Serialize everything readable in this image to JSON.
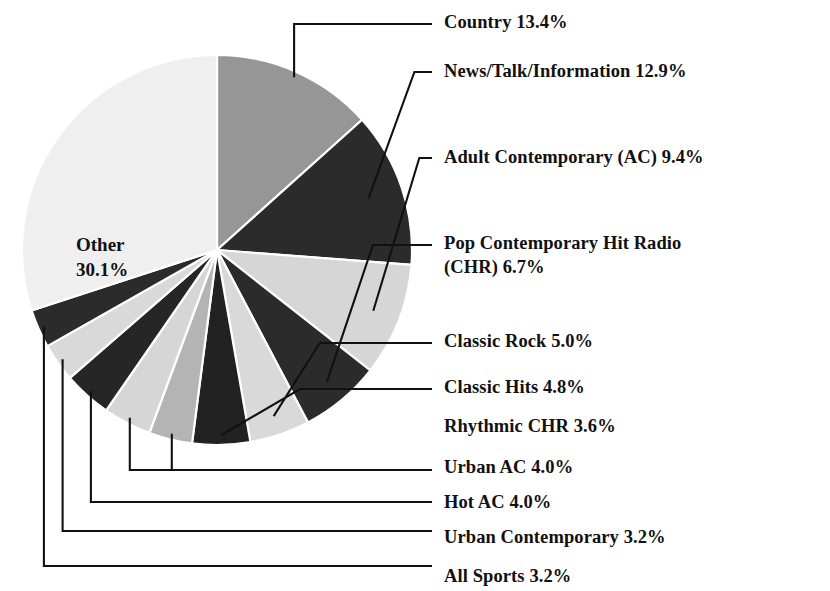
{
  "chart_data": {
    "type": "pie",
    "title": "",
    "subtitle": "",
    "xlabel": "",
    "ylabel": "",
    "legend_position": "callout-labels-right",
    "grid": false,
    "start_angle_deg": 0,
    "direction": "clockwise",
    "units": "percent",
    "categories": [
      "Country",
      "News/Talk/Information",
      "Adult Contemporary (AC)",
      "Pop Contemporary Hit Radio (CHR)",
      "Classic Rock",
      "Classic Hits",
      "Rhythmic CHR",
      "Urban AC",
      "Hot AC",
      "Urban Contemporary",
      "All Sports",
      "Other"
    ],
    "values": [
      13.4,
      12.9,
      9.4,
      6.7,
      5.0,
      4.8,
      3.6,
      4.0,
      4.0,
      3.2,
      3.2,
      30.1
    ],
    "slice_colors": [
      "#969696",
      "#2b2b2b",
      "#d6d6d6",
      "#2b2b2b",
      "#d9d9d9",
      "#222222",
      "#b4b4b4",
      "#d6d6d6",
      "#262626",
      "#d9d9d9",
      "#2b2b2b",
      "#efefef"
    ]
  },
  "inner_label": {
    "name": "Other",
    "value": "30.1%"
  },
  "callouts": [
    {
      "id": "country",
      "text": "Country 13.4%"
    },
    {
      "id": "news-talk-information",
      "text": "News/Talk/Information 12.9%"
    },
    {
      "id": "adult-contemporary-ac",
      "text": "Adult Contemporary (AC) 9.4%"
    },
    {
      "id": "pop-contemporary-hit-radio-chr",
      "text": "Pop Contemporary Hit Radio (CHR) 6.7%"
    },
    {
      "id": "classic-rock",
      "text": "Classic Rock 5.0%"
    },
    {
      "id": "classic-hits",
      "text": "Classic Hits 4.8%"
    },
    {
      "id": "rhythmic-chr",
      "text": "Rhythmic CHR 3.6%"
    },
    {
      "id": "urban-ac",
      "text": "Urban AC 4.0%"
    },
    {
      "id": "hot-ac",
      "text": "Hot AC 4.0%"
    },
    {
      "id": "urban-contemporary",
      "text": "Urban Contemporary 3.2%"
    },
    {
      "id": "all-sports",
      "text": "All Sports 3.2%"
    }
  ],
  "geometry": {
    "center_x": 217,
    "center_y": 250,
    "radius": 195,
    "label_x": 444,
    "label_y": [
      11,
      60,
      146,
      232,
      330,
      376,
      415,
      456,
      491,
      526,
      565
    ]
  },
  "colors": {
    "background": "#ffffff",
    "text": "#111111",
    "leader": "#111111",
    "slice_gap": "#ffffff"
  }
}
